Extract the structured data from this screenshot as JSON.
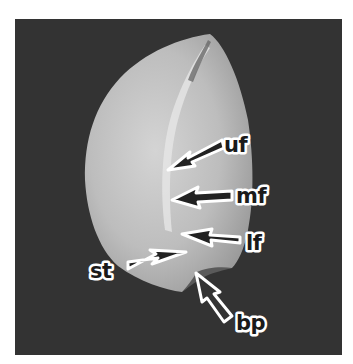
{
  "figure": {
    "type": "grayscale photograph",
    "colors": {
      "page_background": "#ffffff",
      "photo_background": "#333333",
      "seed_fill": "#bdbdbd",
      "seed_highlight": "#e2e2e2",
      "label_fill": "#1a1a1a",
      "label_outline": "#ffffff"
    },
    "labels": [
      {
        "id": "uf",
        "text": "uf"
      },
      {
        "id": "mf",
        "text": "mf"
      },
      {
        "id": "lf",
        "text": "lf"
      },
      {
        "id": "st",
        "text": "st"
      },
      {
        "id": "bp",
        "text": "bp"
      }
    ]
  }
}
